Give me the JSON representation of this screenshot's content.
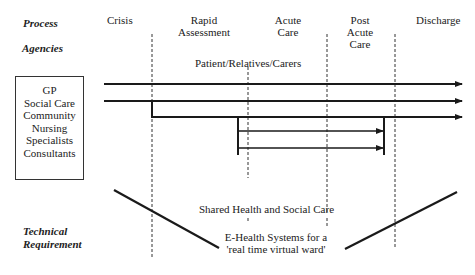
{
  "row_labels": {
    "process": "Process",
    "agencies": "Agencies",
    "technical": [
      "Technical",
      "Requirement"
    ]
  },
  "phases": [
    {
      "lines": [
        "Crisis"
      ]
    },
    {
      "lines": [
        "Rapid",
        "Assessment"
      ]
    },
    {
      "lines": [
        "Acute",
        "Care"
      ]
    },
    {
      "lines": [
        "Post",
        "Acute",
        "Care"
      ]
    },
    {
      "lines": [
        "Discharge"
      ]
    }
  ],
  "agencies": [
    "GP",
    "Social Care",
    "Community",
    "Nursing",
    "Specialists",
    "Consultants"
  ],
  "annotations": {
    "patient": "Patient/Relatives/Carers",
    "shared": "Shared Health and Social Care",
    "ehealth": [
      "E-Health Systems for a",
      "'real time virtual ward'"
    ]
  },
  "colors": {
    "line": "#1a1a1a",
    "text": "#222222"
  }
}
